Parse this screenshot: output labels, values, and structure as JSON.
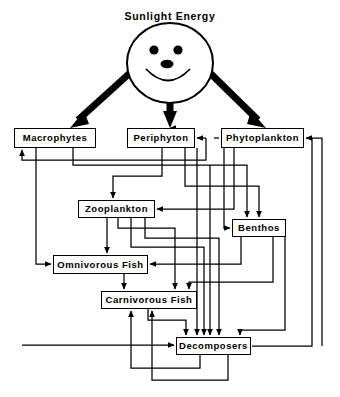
{
  "diagram": {
    "title": "Sunlight  Energy",
    "type": "aquatic-ecosystem-energy-flow-food-web",
    "sun_icon": "smiling-sun-face-icon",
    "colors": {
      "stroke": "#000000",
      "background": "#ffffff",
      "fill": "#ffffff"
    },
    "nodes": [
      {
        "id": "macrophytes",
        "label": "Macrophytes",
        "x": 14,
        "y": 128,
        "w": 82,
        "h": 20
      },
      {
        "id": "periphyton",
        "label": "Periphyton",
        "x": 127,
        "y": 128,
        "w": 68,
        "h": 20
      },
      {
        "id": "phytoplankton",
        "label": "Phytoplankton",
        "x": 221,
        "y": 128,
        "w": 83,
        "h": 20
      },
      {
        "id": "zooplankton",
        "label": "Zooplankton",
        "x": 78,
        "y": 200,
        "w": 77,
        "h": 18
      },
      {
        "id": "benthos",
        "label": "Benthos",
        "x": 232,
        "y": 219,
        "w": 54,
        "h": 18
      },
      {
        "id": "omnivorous-fish",
        "label": "Omnivorous  Fish",
        "x": 53,
        "y": 255,
        "w": 95,
        "h": 19
      },
      {
        "id": "carnivorous-fish",
        "label": "Carnivorous  Fish",
        "x": 101,
        "y": 291,
        "w": 96,
        "h": 18
      },
      {
        "id": "decomposers",
        "label": "Decomposers",
        "x": 176,
        "y": 337,
        "w": 75,
        "h": 18
      }
    ],
    "sun_arrows": [
      {
        "from": "sun",
        "to": "macrophytes"
      },
      {
        "from": "sun",
        "to": "periphyton"
      },
      {
        "from": "sun",
        "to": "phytoplankton"
      }
    ],
    "edges": [
      {
        "from": "periphyton",
        "to": "zooplankton"
      },
      {
        "from": "phytoplankton",
        "to": "zooplankton"
      },
      {
        "from": "macrophytes",
        "to": "benthos"
      },
      {
        "from": "periphyton",
        "to": "benthos"
      },
      {
        "from": "phytoplankton",
        "to": "benthos"
      },
      {
        "from": "zooplankton",
        "to": "omnivorous-fish"
      },
      {
        "from": "benthos",
        "to": "omnivorous-fish"
      },
      {
        "from": "macrophytes",
        "to": "omnivorous-fish"
      },
      {
        "from": "omnivorous-fish",
        "to": "carnivorous-fish"
      },
      {
        "from": "zooplankton",
        "to": "carnivorous-fish"
      },
      {
        "from": "benthos",
        "to": "carnivorous-fish"
      },
      {
        "from": "macrophytes",
        "to": "decomposers"
      },
      {
        "from": "periphyton",
        "to": "decomposers"
      },
      {
        "from": "phytoplankton",
        "to": "decomposers"
      },
      {
        "from": "zooplankton",
        "to": "decomposers"
      },
      {
        "from": "benthos",
        "to": "decomposers"
      },
      {
        "from": "omnivorous-fish",
        "to": "decomposers"
      },
      {
        "from": "carnivorous-fish",
        "to": "decomposers"
      },
      {
        "from": "decomposers",
        "to": "macrophytes"
      },
      {
        "from": "decomposers",
        "to": "periphyton"
      },
      {
        "from": "decomposers",
        "to": "phytoplankton"
      },
      {
        "from": "decomposers",
        "to": "carnivorous-fish"
      }
    ]
  }
}
